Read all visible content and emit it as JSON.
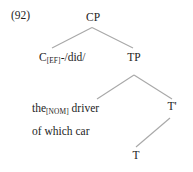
{
  "figure": {
    "example_number": "(92)",
    "type": "syntax-tree",
    "line_color": "#a8a8a8",
    "text_color": "#1d1d1d",
    "background": "#ffffff"
  },
  "nodes": {
    "cp": {
      "label": "CP"
    },
    "c": {
      "head": "C",
      "subscript": "[EF]",
      "suffix": "-/did/"
    },
    "tp": {
      "label": "TP"
    },
    "subject_line1_pre": "the",
    "subject_line1_sub": "[NOM]",
    "subject_line1_post": " driver",
    "subject_line2": "of which car",
    "tbar": {
      "label": "T'"
    },
    "t": {
      "label": "T"
    }
  }
}
